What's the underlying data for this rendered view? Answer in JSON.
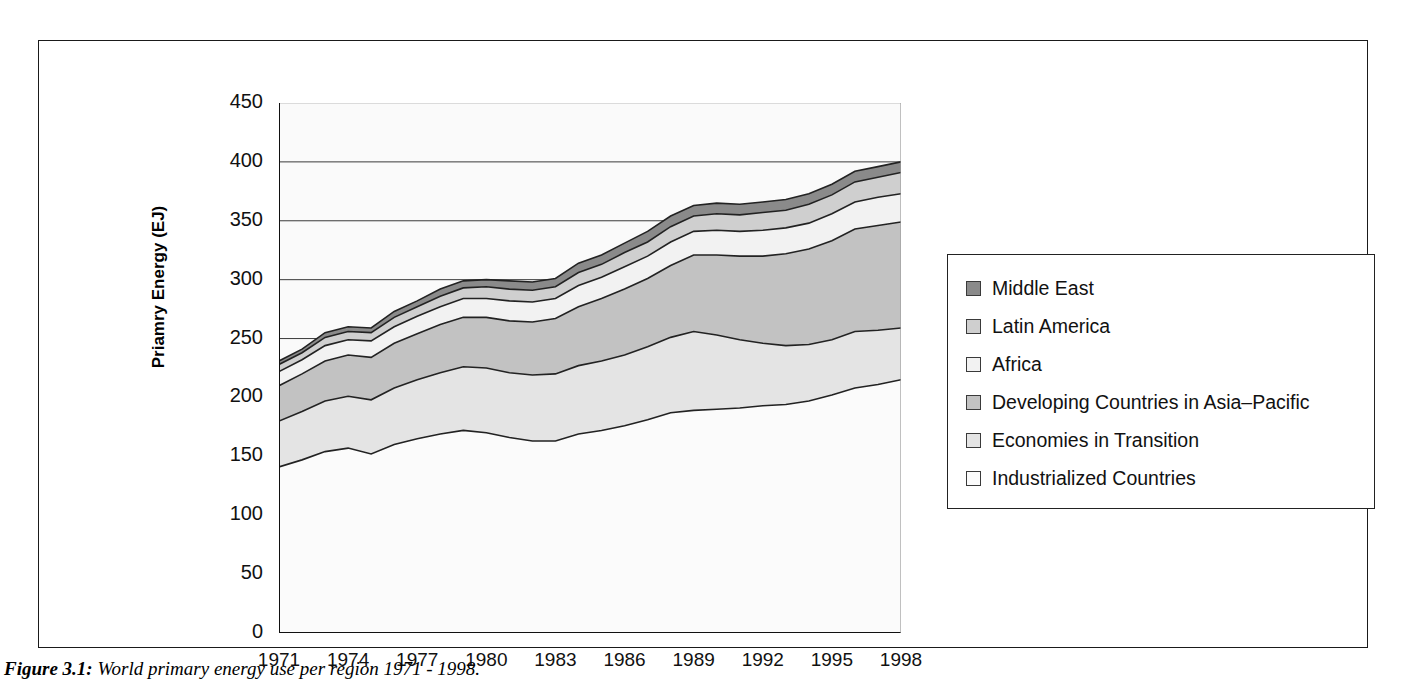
{
  "caption": {
    "prefix": "Figure 3.1:",
    "text": "World primary energy use per region 1971 - 1998."
  },
  "axes": {
    "ylabel": "Priamry Energy (EJ)",
    "xlabel": "",
    "y_ticks": [
      "0",
      "50",
      "100",
      "150",
      "200",
      "250",
      "300",
      "350",
      "400",
      "450"
    ],
    "x_ticks": [
      "1971",
      "1974",
      "1977",
      "1980",
      "1983",
      "1986",
      "1989",
      "1992",
      "1995",
      "1998"
    ]
  },
  "legend": {
    "items": [
      {
        "label": "Middle East",
        "color": "#8a8a8a"
      },
      {
        "label": "Latin America",
        "color": "#cfcfcf"
      },
      {
        "label": "Africa",
        "color": "#f2f2f2"
      },
      {
        "label": "Developing Countries in Asia–Pacific",
        "color": "#c2c2c2"
      },
      {
        "label": "Economies in Transition",
        "color": "#e4e4e4"
      },
      {
        "label": "Industrialized Countries",
        "color": "#fbfbfb"
      }
    ]
  },
  "chart_data": {
    "type": "area",
    "stacked": true,
    "title": "",
    "xlabel": "",
    "ylabel": "Priamry Energy (EJ)",
    "xlim": [
      1971,
      1998
    ],
    "ylim": [
      0,
      450
    ],
    "ytick_step": 50,
    "xtick_step": 3,
    "grid": "horizontal",
    "legend_position": "right",
    "x": [
      1971,
      1972,
      1973,
      1974,
      1975,
      1976,
      1977,
      1978,
      1979,
      1980,
      1981,
      1982,
      1983,
      1984,
      1985,
      1986,
      1987,
      1988,
      1989,
      1990,
      1991,
      1992,
      1993,
      1994,
      1995,
      1996,
      1997,
      1998
    ],
    "series": [
      {
        "name": "Industrialized Countries",
        "color": "#fbfbfb",
        "values": [
          141,
          147,
          154,
          157,
          152,
          160,
          165,
          169,
          172,
          170,
          166,
          163,
          163,
          169,
          172,
          176,
          181,
          187,
          189,
          190,
          191,
          193,
          194,
          197,
          202,
          208,
          211,
          215
        ]
      },
      {
        "name": "Economies in Transition",
        "color": "#e4e4e4",
        "values": [
          39,
          41,
          43,
          44,
          46,
          48,
          50,
          52,
          54,
          55,
          55,
          56,
          57,
          58,
          59,
          60,
          62,
          64,
          67,
          63,
          58,
          53,
          50,
          48,
          47,
          48,
          46,
          44
        ]
      },
      {
        "name": "Developing Countries in Asia–Pacific",
        "color": "#c2c2c2",
        "values": [
          30,
          32,
          34,
          35,
          36,
          38,
          39,
          41,
          42,
          43,
          44,
          45,
          47,
          50,
          53,
          56,
          58,
          61,
          65,
          68,
          71,
          74,
          78,
          81,
          84,
          87,
          89,
          90
        ]
      },
      {
        "name": "Africa",
        "color": "#f2f2f2",
        "values": [
          12,
          12,
          13,
          13,
          14,
          14,
          15,
          15,
          16,
          16,
          17,
          17,
          17,
          18,
          18,
          19,
          19,
          20,
          20,
          21,
          21,
          22,
          22,
          22,
          23,
          23,
          24,
          24
        ]
      },
      {
        "name": "Latin America",
        "color": "#cfcfcf",
        "values": [
          6,
          6,
          7,
          7,
          7,
          8,
          8,
          9,
          9,
          10,
          10,
          10,
          10,
          11,
          11,
          12,
          12,
          13,
          13,
          14,
          14,
          15,
          15,
          16,
          16,
          17,
          17,
          18
        ]
      },
      {
        "name": "Middle East",
        "color": "#8a8a8a",
        "values": [
          3,
          3,
          4,
          4,
          4,
          5,
          5,
          6,
          6,
          6,
          7,
          7,
          7,
          8,
          8,
          8,
          9,
          9,
          9,
          9,
          9,
          9,
          9,
          9,
          9,
          9,
          9,
          9
        ]
      }
    ]
  }
}
